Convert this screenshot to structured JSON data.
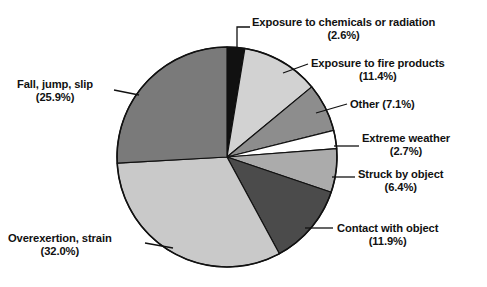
{
  "chart_data": {
    "type": "pie",
    "title": "",
    "subtitle": "",
    "xlabel": "",
    "ylabel": "",
    "legend_position": "callout-labels",
    "grid": false,
    "units": "percent",
    "start_angle_deg": 0,
    "direction": "clockwise",
    "categories": [
      "Exposure to chemicals or radiation",
      "Exposure to fire products",
      "Other",
      "Extreme weather",
      "Struck by object",
      "Contact with object",
      "Overexertion, strain",
      "Fall, jump, slip"
    ],
    "values": [
      2.6,
      11.4,
      7.1,
      2.7,
      6.4,
      11.9,
      32.0,
      25.9
    ],
    "total": 100.0,
    "colors": [
      "#111111",
      "#d2d2d2",
      "#8d8d8d",
      "#ffffff",
      "#ababab",
      "#4b4b4b",
      "#c9c9c9",
      "#7a7a7a"
    ],
    "slices": [
      {
        "label": "Exposure to chemicals or radiation",
        "value": 2.6,
        "value_text": "(2.6%)",
        "color": "#111111"
      },
      {
        "label": "Exposure to fire products",
        "value": 11.4,
        "value_text": "(11.4%)",
        "color": "#d2d2d2"
      },
      {
        "label": "Other",
        "value": 7.1,
        "value_text": "(7.1%)",
        "color": "#8d8d8d"
      },
      {
        "label": "Extreme weather",
        "value": 2.7,
        "value_text": "(2.7%)",
        "color": "#ffffff"
      },
      {
        "label": "Struck by object",
        "value": 6.4,
        "value_text": "(6.4%)",
        "color": "#ababab"
      },
      {
        "label": "Contact with object",
        "value": 11.9,
        "value_text": "(11.9%)",
        "color": "#4b4b4b"
      },
      {
        "label": "Overexertion, strain",
        "value": 32.0,
        "value_text": "(32.0%)",
        "color": "#c9c9c9"
      },
      {
        "label": "Fall, jump, slip",
        "value": 25.9,
        "value_text": "(25.9%)",
        "color": "#7a7a7a"
      }
    ]
  },
  "labels": {
    "chemicals": {
      "line1": "Exposure to chemicals or radiation",
      "line2": "(2.6%)"
    },
    "fire": {
      "line1": "Exposure to fire products",
      "line2": "(11.4%)"
    },
    "other": {
      "line1": "Other (7.1%)",
      "line2": ""
    },
    "weather": {
      "line1": "Extreme weather",
      "line2": "(2.7%)"
    },
    "struck": {
      "line1": "Struck by object",
      "line2": "(6.4%)"
    },
    "contact": {
      "line1": "Contact with object",
      "line2": "(11.9%)"
    },
    "fall": {
      "line1": "Fall, jump, slip",
      "line2": "(25.9%)"
    },
    "overex": {
      "line1": "Overexertion, strain",
      "line2": "(32.0%)"
    }
  }
}
